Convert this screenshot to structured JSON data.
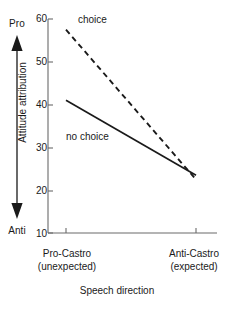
{
  "chart_data": {
    "type": "line",
    "title": "",
    "xlabel": "Speech direction",
    "ylabel": "Attitude attribution",
    "categories": [
      "Pro-Castro (unexpected)",
      "Anti-Castro (expected)"
    ],
    "category_lines": [
      [
        "Pro-Castro",
        "(unexpected)"
      ],
      [
        "Anti-Castro",
        "(expected)"
      ]
    ],
    "ylim": [
      10,
      60
    ],
    "yticks": [
      60,
      50,
      40,
      30,
      20,
      10
    ],
    "grid": false,
    "legend": "inline-annotations",
    "series": [
      {
        "name": "choice",
        "style": "dashed",
        "values": [
          57.5,
          22.5
        ]
      },
      {
        "name": "no choice",
        "style": "solid",
        "values": [
          41,
          23.5
        ]
      }
    ],
    "annotations": [
      {
        "text": "choice",
        "series": "choice"
      },
      {
        "text": "no choice",
        "series": "no choice"
      }
    ],
    "y_axis_direction": {
      "top_label": "Pro",
      "bottom_label": "Anti"
    }
  },
  "axes": {
    "y_title": "Attitude attribution",
    "y_top_anchor": "Pro",
    "y_bottom_anchor": "Anti",
    "x_title": "Speech direction",
    "ytick_labels": [
      "60",
      "50",
      "40",
      "30",
      "20",
      "10"
    ],
    "xcat_0_line1": "Pro-Castro",
    "xcat_0_line2": "(unexpected)",
    "xcat_1_line1": "Anti-Castro",
    "xcat_1_line2": "(expected)"
  },
  "series_labels": {
    "choice": "choice",
    "no_choice": "no choice"
  },
  "colors": {
    "axis": "#555555",
    "line": "#1a1a1a",
    "text": "#1a1a1a",
    "background": "#ffffff"
  }
}
